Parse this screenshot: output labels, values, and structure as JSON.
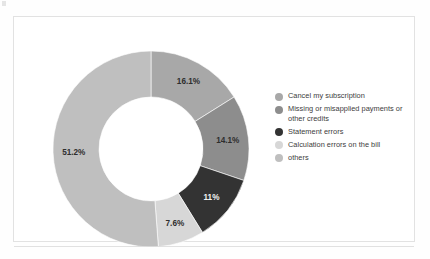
{
  "chart_data": {
    "type": "pie",
    "variant": "donut",
    "title": "",
    "subtitle": "",
    "xlabel": "",
    "ylabel": "",
    "grid": false,
    "legend_position": "right",
    "value_unit": "percent",
    "start_angle_deg": 0,
    "direction": "clockwise",
    "categories": [
      "Cancel my subscription",
      "Missing or misapplied payments or other credits",
      "Statement errors",
      "Calculation errors on the bill",
      "others"
    ],
    "values": [
      16.1,
      14.1,
      11,
      7.6,
      51.2
    ],
    "data_labels": [
      "16.1%",
      "14.1%",
      "11%",
      "7.6%",
      "51.2%"
    ],
    "colors": [
      "#a8a8a8",
      "#8d8d8d",
      "#333333",
      "#d7d7d7",
      "#bfbfbf"
    ],
    "label_colors": [
      "#2e2e2e",
      "#2e2e2e",
      "#f2f2f2",
      "#2e2e2e",
      "#2e2e2e"
    ]
  },
  "legend": {
    "items": [
      {
        "label": "Cancel my subscription",
        "color": "#a8a8a8",
        "value": "16.1%"
      },
      {
        "label": "Missing or misapplied payments or other credits",
        "color": "#8d8d8d",
        "value": "14.1%"
      },
      {
        "label": "Statement errors",
        "color": "#333333",
        "value": "11%"
      },
      {
        "label": "Calculation errors on the bill",
        "color": "#d7d7d7",
        "value": "7.6%"
      },
      {
        "label": "others",
        "color": "#bfbfbf",
        "value": "51.2%"
      }
    ]
  },
  "slice_labels": {
    "s0": "16.1%",
    "s1": "14.1%",
    "s2": "11%",
    "s3": "7.6%",
    "s4": "51.2%"
  }
}
